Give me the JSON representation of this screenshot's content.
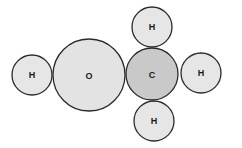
{
  "diagram": {
    "type": "space-filling molecule model",
    "molecule": "methanol",
    "colors": {
      "background": "#ffffff",
      "outline": "#2a2a2a",
      "hydrogen_fill": "#e6e6e6",
      "oxygen_fill": "#e3e3e3",
      "carbon_fill": "#c9c9c9"
    },
    "atoms": [
      {
        "id": "h1",
        "label": "H",
        "cx": 32,
        "cy": 75,
        "r": 20
      },
      {
        "id": "o",
        "label": "O",
        "cx": 89,
        "cy": 75,
        "r": 36
      },
      {
        "id": "c",
        "label": "C",
        "cx": 152,
        "cy": 74,
        "r": 26
      },
      {
        "id": "h2",
        "label": "H",
        "cx": 152,
        "cy": 27,
        "r": 20
      },
      {
        "id": "h3",
        "label": "H",
        "cx": 201,
        "cy": 73,
        "r": 20
      },
      {
        "id": "h4",
        "label": "H",
        "cx": 154,
        "cy": 121,
        "r": 20
      }
    ]
  }
}
